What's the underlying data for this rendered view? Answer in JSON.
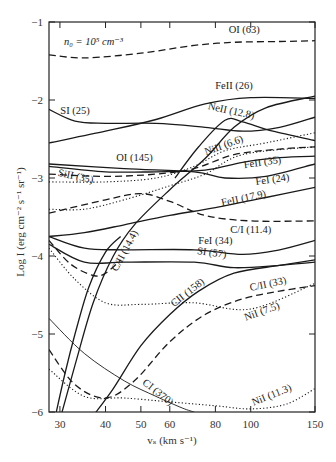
{
  "chart_data": {
    "type": "line",
    "title": "",
    "annotation": "n₀ = 10⁵ cm⁻³",
    "xlabel": "vₛ (km s⁻¹)",
    "ylabel": "Log I (erg cm⁻² s⁻¹ sr⁻¹)",
    "xscale": "log",
    "xlim": [
      28,
      150
    ],
    "ylim": [
      -6,
      -1
    ],
    "xticks": [
      30,
      40,
      50,
      60,
      80,
      100,
      150
    ],
    "yticks": [
      -1,
      -2,
      -3,
      -4,
      -5,
      -6
    ],
    "grid": false,
    "legend": "inline labels",
    "series": [
      {
        "name": "OI (63)",
        "style": "dashed",
        "points": [
          [
            28,
            -1.42
          ],
          [
            35,
            -1.46
          ],
          [
            50,
            -1.4
          ],
          [
            70,
            -1.3
          ],
          [
            90,
            -1.26
          ],
          [
            120,
            -1.25
          ],
          [
            150,
            -1.24
          ]
        ],
        "label_at": [
          96,
          -1.14,
          0
        ]
      },
      {
        "name": "FeII (26)",
        "style": "solid",
        "points": [
          [
            28,
            -2.55
          ],
          [
            40,
            -2.4
          ],
          [
            55,
            -2.25
          ],
          [
            75,
            -2.05
          ],
          [
            100,
            -1.97
          ],
          [
            150,
            -1.98
          ]
        ],
        "label_at": [
          90,
          -1.86,
          0
        ]
      },
      {
        "name": "SI (25)",
        "style": "solid",
        "points": [
          [
            28,
            -2.12
          ],
          [
            33,
            -2.27
          ],
          [
            40,
            -2.3
          ],
          [
            55,
            -2.3
          ],
          [
            75,
            -2.35
          ],
          [
            95,
            -2.4
          ],
          [
            120,
            -2.35
          ],
          [
            150,
            -2.22
          ]
        ],
        "label_at": [
          33,
          -2.18,
          0
        ]
      },
      {
        "name": "NeII (12.8)",
        "style": "solid",
        "points": [
          [
            62,
            -3.0
          ],
          [
            72,
            -2.6
          ],
          [
            85,
            -2.26
          ],
          [
            95,
            -2.28
          ],
          [
            115,
            -2.4
          ],
          [
            150,
            -2.52
          ]
        ],
        "label_at": [
          88,
          -2.18,
          12
        ]
      },
      {
        "name": "NiII (6.6)",
        "style": "dotted",
        "points": [
          [
            28,
            -3.05
          ],
          [
            40,
            -3.05
          ],
          [
            55,
            -3.0
          ],
          [
            70,
            -2.85
          ],
          [
            85,
            -2.65
          ],
          [
            110,
            -2.55
          ],
          [
            150,
            -2.42
          ]
        ],
        "label_at": [
          85,
          -2.62,
          -20
        ]
      },
      {
        "name": "OI (145)",
        "style": "dashed",
        "points": [
          [
            28,
            -2.95
          ],
          [
            40,
            -2.98
          ],
          [
            55,
            -2.95
          ],
          [
            70,
            -2.88
          ],
          [
            90,
            -2.7
          ],
          [
            120,
            -2.63
          ],
          [
            150,
            -2.6
          ]
        ],
        "label_at": [
          48,
          -2.78,
          0
        ]
      },
      {
        "name": "FeII (35)",
        "style": "solid",
        "points": [
          [
            28,
            -2.85
          ],
          [
            40,
            -2.92
          ],
          [
            55,
            -2.92
          ],
          [
            75,
            -2.9
          ],
          [
            95,
            -2.8
          ],
          [
            120,
            -2.74
          ],
          [
            150,
            -2.72
          ]
        ],
        "label_at": [
          108,
          -2.84,
          -8
        ]
      },
      {
        "name": "FeI (24)",
        "style": "solid",
        "points": [
          [
            28,
            -2.82
          ],
          [
            45,
            -2.88
          ],
          [
            70,
            -2.92
          ],
          [
            85,
            -3.0
          ],
          [
            110,
            -2.98
          ],
          [
            150,
            -2.82
          ]
        ],
        "label_at": [
          115,
          -3.06,
          -8
        ]
      },
      {
        "name": "SiII (35)",
        "style": "dotted",
        "points": [
          [
            28,
            -3.4
          ],
          [
            35,
            -3.4
          ],
          [
            45,
            -3.28
          ],
          [
            60,
            -3.1
          ],
          [
            75,
            -2.95
          ],
          [
            95,
            -2.7
          ],
          [
            150,
            -2.6
          ]
        ],
        "label_at": [
          33,
          -3.02,
          12
        ]
      },
      {
        "name": "FeII (17.9)",
        "style": "solid",
        "points": [
          [
            28,
            -3.75
          ],
          [
            35,
            -3.7
          ],
          [
            45,
            -3.6
          ],
          [
            60,
            -3.48
          ],
          [
            80,
            -3.38
          ],
          [
            110,
            -3.25
          ],
          [
            150,
            -3.12
          ]
        ],
        "label_at": [
          96,
          -3.3,
          -12
        ]
      },
      {
        "name": "C/I (11.4)",
        "style": "dashed",
        "points": [
          [
            28,
            -3.45
          ],
          [
            40,
            -3.28
          ],
          [
            50,
            -3.2
          ],
          [
            60,
            -3.3
          ],
          [
            75,
            -3.48
          ],
          [
            100,
            -3.55
          ],
          [
            150,
            -3.55
          ]
        ],
        "label_at": [
          100,
          -3.7,
          0
        ]
      },
      {
        "name": "C/II (14.4)",
        "style": "solid",
        "points": [
          [
            30,
            -6.1
          ],
          [
            33,
            -5.4
          ],
          [
            37,
            -4.6
          ],
          [
            42,
            -4.0
          ],
          [
            48,
            -3.6
          ],
          [
            60,
            -3.15
          ],
          [
            75,
            -2.75
          ],
          [
            90,
            -2.35
          ],
          [
            110,
            -2.1
          ],
          [
            150,
            -1.95
          ]
        ],
        "label_at": [
          46,
          -3.95,
          -62
        ]
      },
      {
        "name": "FeI (34)",
        "style": "solid",
        "points": [
          [
            28,
            -3.75
          ],
          [
            35,
            -3.9
          ],
          [
            45,
            -3.92
          ],
          [
            70,
            -3.92
          ],
          [
            95,
            -3.98
          ],
          [
            120,
            -3.92
          ],
          [
            150,
            -3.8
          ]
        ],
        "label_at": [
          80,
          -3.84,
          0
        ]
      },
      {
        "name": "SI (57)",
        "style": "solid",
        "points": [
          [
            28,
            -3.85
          ],
          [
            35,
            -4.08
          ],
          [
            45,
            -4.08
          ],
          [
            70,
            -4.08
          ],
          [
            90,
            -4.15
          ],
          [
            120,
            -4.12
          ],
          [
            150,
            -4.08
          ]
        ],
        "label_at": [
          78,
          -4.0,
          8
        ]
      },
      {
        "name": "CII (158)",
        "style": "solid",
        "points": [
          [
            37,
            -6.05
          ],
          [
            42,
            -5.7
          ],
          [
            50,
            -5.15
          ],
          [
            60,
            -4.75
          ],
          [
            72,
            -4.45
          ],
          [
            90,
            -4.22
          ],
          [
            120,
            -4.12
          ],
          [
            150,
            -4.05
          ]
        ],
        "label_at": [
          68,
          -4.5,
          -38
        ]
      },
      {
        "name": "C/II (33)",
        "style": "dashed",
        "points": [
          [
            28,
            -5.2
          ],
          [
            33,
            -5.65
          ],
          [
            40,
            -5.82
          ],
          [
            48,
            -5.6
          ],
          [
            60,
            -5.1
          ],
          [
            75,
            -4.75
          ],
          [
            95,
            -4.55
          ],
          [
            120,
            -4.45
          ],
          [
            150,
            -4.38
          ]
        ],
        "label_at": [
          112,
          -4.4,
          -12
        ]
      },
      {
        "name": "NiI (7.5)",
        "style": "dotted",
        "points": [
          [
            28,
            -3.9
          ],
          [
            33,
            -4.3
          ],
          [
            40,
            -4.6
          ],
          [
            50,
            -4.62
          ],
          [
            70,
            -4.6
          ],
          [
            100,
            -4.68
          ],
          [
            150,
            -4.35
          ]
        ],
        "label_at": [
          108,
          -4.75,
          -20
        ]
      },
      {
        "name": "CI (370)",
        "style": "thin",
        "points": [
          [
            28,
            -4.8
          ],
          [
            35,
            -5.25
          ],
          [
            45,
            -5.6
          ],
          [
            55,
            -5.8
          ],
          [
            65,
            -5.95
          ],
          [
            70,
            -6.0
          ]
        ],
        "label_at": [
          55,
          -5.78,
          38
        ]
      },
      {
        "name": "NiI (11.3)",
        "style": "dotted",
        "points": [
          [
            28,
            -5.45
          ],
          [
            35,
            -5.8
          ],
          [
            45,
            -5.82
          ],
          [
            60,
            -5.87
          ],
          [
            80,
            -5.92
          ],
          [
            100,
            -5.96
          ],
          [
            125,
            -5.9
          ],
          [
            150,
            -5.7
          ]
        ],
        "label_at": [
          115,
          -5.82,
          -22
        ]
      },
      {
        "name": "unlabeled-steep-solid",
        "style": "solid",
        "points": [
          [
            29,
            -6.1
          ],
          [
            31,
            -5.5
          ],
          [
            33,
            -5.0
          ],
          [
            36,
            -4.4
          ],
          [
            40,
            -3.95
          ],
          [
            44,
            -3.75
          ]
        ],
        "label_at": null
      },
      {
        "name": "unlabeled-dashed-dip",
        "style": "dashed",
        "points": [
          [
            28,
            -3.8
          ],
          [
            32,
            -4.1
          ],
          [
            37,
            -4.25
          ],
          [
            40,
            -4.22
          ],
          [
            44,
            -4.05
          ]
        ],
        "label_at": null
      }
    ]
  }
}
